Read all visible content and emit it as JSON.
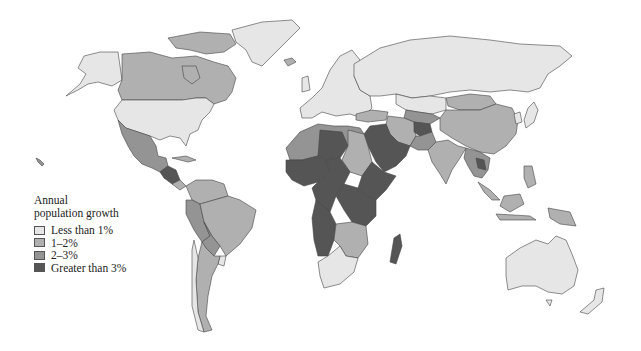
{
  "legend": {
    "title_line1": "Annual",
    "title_line2": "population growth",
    "items": [
      {
        "label": "Less than 1%",
        "color": "#e6e6e6"
      },
      {
        "label": "1–2%",
        "color": "#b0b0b0"
      },
      {
        "label": "2–3%",
        "color": "#949494"
      },
      {
        "label": "Greater than 3%",
        "color": "#555555"
      }
    ]
  },
  "colors": {
    "low": "#e6e6e6",
    "mid1": "#b0b0b0",
    "mid2": "#949494",
    "high": "#555555",
    "border": "#444444"
  }
}
